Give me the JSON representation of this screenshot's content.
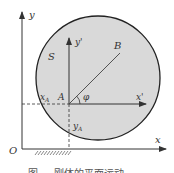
{
  "figure": {
    "labels": {
      "y": "y",
      "x": "x",
      "origin": "O",
      "body": "S",
      "y_prime": "y'",
      "x_prime": "x'",
      "point_a": "A",
      "point_b": "B",
      "angle": "φ",
      "x_a": "x",
      "x_a_sub": "A",
      "y_a": "y",
      "y_a_sub": "A"
    },
    "caption": "图 ... 刚体的平面运动",
    "colors": {
      "fill": "#d9d9d9",
      "stroke": "#222222",
      "background": "#ffffff"
    }
  }
}
